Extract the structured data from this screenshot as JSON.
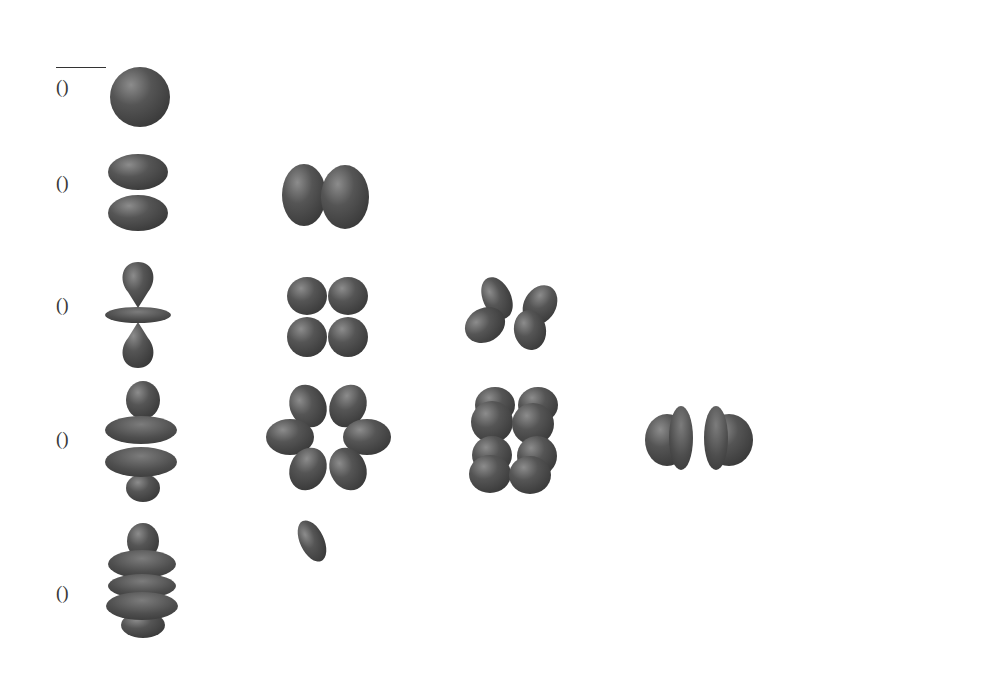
{
  "figure": {
    "header": {
      "n": "n",
      "l": "l"
    },
    "rows": [
      {
        "n": "1",
        "l": "0",
        "name": "(1s)",
        "name_num": "1",
        "name_letter": "s"
      },
      {
        "n": "2",
        "l": "1",
        "name": "(2p)",
        "name_num": "2",
        "name_letter": "p"
      },
      {
        "n": "3",
        "l": "2",
        "name": "(3d)",
        "name_num": "3",
        "name_letter": "d"
      },
      {
        "n": "4",
        "l": "3",
        "name": "(4f)",
        "name_num": "4",
        "name_letter": "f"
      },
      {
        "n": "5",
        "l": "4",
        "name": "(5g)",
        "name_num": "5",
        "name_letter": "g"
      }
    ],
    "axis": {
      "label": "|m_l|",
      "label_m": "m",
      "label_sub": "ℓ",
      "columns": [
        "0",
        "1",
        "2",
        "3",
        "4"
      ]
    },
    "orbital_color": "#4a4a4a",
    "orbital_highlight": "#8a8a8a",
    "orbitals": [
      {
        "row": "1s",
        "m": "0",
        "shape": "sphere"
      },
      {
        "row": "2p",
        "m": "0",
        "shape": "two lobes stacked vertically"
      },
      {
        "row": "2p",
        "m": "1",
        "shape": "two lobes side by side"
      },
      {
        "row": "3d",
        "m": "0",
        "shape": "lobes up/down with torus"
      },
      {
        "row": "3d",
        "m": "1",
        "shape": "four-leaf clover"
      },
      {
        "row": "3d",
        "m": "2",
        "shape": "tilted four lobes"
      },
      {
        "row": "4f",
        "m": "0",
        "shape": "lobes with two tori"
      },
      {
        "row": "4f",
        "m": "1",
        "shape": "six-petal ring"
      },
      {
        "row": "4f",
        "m": "2",
        "shape": "eight lobes in cube"
      },
      {
        "row": "4f",
        "m": "3",
        "shape": "two split discs"
      },
      {
        "row": "5g",
        "m": "0",
        "shape": "lobes with three tori"
      },
      {
        "row": "5g",
        "m": "1",
        "shape": "eight-petal ring"
      },
      {
        "row": "5g",
        "m": "2",
        "shape": "multi-lobe cluster"
      },
      {
        "row": "5g",
        "m": "3",
        "shape": "twelve-lobe cluster"
      },
      {
        "row": "5g",
        "m": "4",
        "shape": "eight-lobe band"
      }
    ]
  }
}
